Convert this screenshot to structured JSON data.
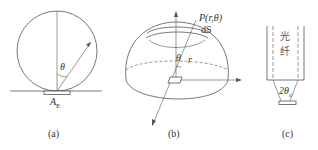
{
  "figure": {
    "panels": [
      {
        "id": "a",
        "caption": "(a)",
        "labels": {
          "angle": "θ",
          "area": "A",
          "area_sub": "E"
        }
      },
      {
        "id": "b",
        "caption": "(b)",
        "labels": {
          "point": "P(r,θ)",
          "surface": "dS",
          "angle": "θ",
          "radius": "r"
        }
      },
      {
        "id": "c",
        "caption": "(c)",
        "labels": {
          "fiber_char1": "光",
          "fiber_char2": "纤",
          "angle": "2θ",
          "angle_sub": "c"
        }
      }
    ]
  }
}
